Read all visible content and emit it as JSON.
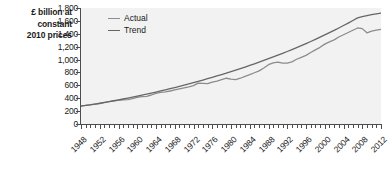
{
  "chart_data": {
    "type": "line",
    "title": "",
    "xlabel": "",
    "ylabel": "£ billion at constant 2010 prices",
    "ylim": [
      0,
      1800
    ],
    "xlim": [
      1948,
      2012
    ],
    "grid": false,
    "legend_position": "top-left",
    "y_ticks": [
      "1,800",
      "1,600",
      "1,400",
      "1,200",
      "1,000",
      "800",
      "600",
      "400",
      "200",
      "0"
    ],
    "y_tick_values": [
      1800,
      1600,
      1400,
      1200,
      1000,
      800,
      600,
      400,
      200,
      0
    ],
    "x_ticks": [
      "1948",
      "1952",
      "1956",
      "1960",
      "1964",
      "1968",
      "1972",
      "1976",
      "1980",
      "1984",
      "1988",
      "1992",
      "1996",
      "2000",
      "2004",
      "2008",
      "2012"
    ],
    "x_tick_values": [
      1948,
      1952,
      1956,
      1960,
      1964,
      1968,
      1972,
      1976,
      1980,
      1984,
      1988,
      1992,
      1996,
      2000,
      2004,
      2008,
      2012
    ],
    "x": [
      1948,
      1949,
      1950,
      1951,
      1952,
      1953,
      1954,
      1955,
      1956,
      1957,
      1958,
      1959,
      1960,
      1961,
      1962,
      1963,
      1964,
      1965,
      1966,
      1967,
      1968,
      1969,
      1970,
      1971,
      1972,
      1973,
      1974,
      1975,
      1976,
      1977,
      1978,
      1979,
      1980,
      1981,
      1982,
      1983,
      1984,
      1985,
      1986,
      1987,
      1988,
      1989,
      1990,
      1991,
      1992,
      1993,
      1994,
      1995,
      1996,
      1997,
      1998,
      1999,
      2000,
      2001,
      2002,
      2003,
      2004,
      2005,
      2006,
      2007,
      2008,
      2009,
      2010,
      2011,
      2012
    ],
    "series": [
      {
        "name": "Actual",
        "color": "#8c8c8c",
        "values": [
          282,
          290,
          300,
          310,
          315,
          330,
          347,
          360,
          367,
          375,
          378,
          395,
          415,
          425,
          430,
          450,
          475,
          490,
          500,
          512,
          530,
          545,
          560,
          575,
          595,
          635,
          630,
          625,
          650,
          665,
          690,
          710,
          695,
          690,
          710,
          740,
          765,
          795,
          825,
          870,
          920,
          950,
          960,
          945,
          945,
          965,
          1005,
          1035,
          1065,
          1110,
          1150,
          1190,
          1240,
          1275,
          1305,
          1350,
          1385,
          1420,
          1455,
          1490,
          1480,
          1415,
          1440,
          1455,
          1470
        ]
      },
      {
        "name": "Trend",
        "color": "#666666",
        "values": [
          278,
          288,
          298,
          310,
          322,
          335,
          348,
          361,
          374,
          388,
          402,
          417,
          432,
          447,
          463,
          479,
          496,
          513,
          530,
          548,
          566,
          584,
          603,
          622,
          642,
          662,
          682,
          703,
          724,
          746,
          768,
          790,
          813,
          836,
          860,
          884,
          909,
          934,
          960,
          986,
          1013,
          1040,
          1068,
          1096,
          1125,
          1155,
          1185,
          1216,
          1248,
          1280,
          1313,
          1347,
          1382,
          1417,
          1453,
          1490,
          1528,
          1566,
          1606,
          1646,
          1666,
          1683,
          1697,
          1709,
          1720
        ]
      }
    ]
  },
  "legend": {
    "items": [
      {
        "label": "Actual"
      },
      {
        "label": "Trend"
      }
    ]
  },
  "axis_title": {
    "line1": "£ billion at",
    "line2": "constant",
    "line3": "2010 prices"
  },
  "colors": {
    "plot_background": "#f2f2f2",
    "axis": "#4d4d4d",
    "text": "#1a1a1a",
    "actual": "#8c8c8c",
    "trend": "#666666"
  }
}
